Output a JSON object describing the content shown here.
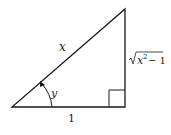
{
  "diagram": {
    "type": "right-triangle",
    "labels": {
      "hypotenuse": "x",
      "angle": "y",
      "adjacent": "1",
      "opposite_radicand_base": "x",
      "opposite_exponent": "2",
      "opposite_rest": "− 1"
    },
    "colors": {
      "stroke": "#1a1a1a",
      "background": "#ffffff"
    }
  }
}
